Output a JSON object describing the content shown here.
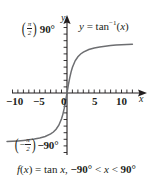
{
  "figure": {
    "caption": "f(x) = tan x, −90° < x < 90°",
    "caption_parts": {
      "fx": "f",
      "open": "(",
      "var1": "x",
      "close": ")",
      "equals": " = tan ",
      "var2": "x",
      "comma": ", ",
      "lower": "−90°",
      "lt1": " < ",
      "var3": "x",
      "lt2": " < ",
      "upper": "90°"
    },
    "equation": {
      "y": "y",
      "equals": " = ",
      "func": "tan",
      "exponent": "−1",
      "open": "(",
      "arg": "x",
      "close": ")"
    },
    "axes": {
      "x_label": "x",
      "y_label": "y",
      "x_ticks": [
        "−10",
        "−5",
        "0",
        "5",
        "10"
      ],
      "x_tick_values": [
        -10,
        -5,
        0,
        5,
        10
      ],
      "x_range": [
        -11.2,
        12.5
      ],
      "y_range": [
        -110,
        110
      ],
      "upper_asymptote_label": "90°",
      "upper_asymptote_fraction": {
        "numerator": "π",
        "denominator": "2",
        "sign": ""
      },
      "lower_asymptote_label": "−90°",
      "lower_asymptote_fraction": {
        "numerator": "π",
        "denominator": "2",
        "sign": "−"
      }
    },
    "colors": {
      "curve": "#6d6e71",
      "axis": "#231f20",
      "text": "#231f20",
      "background": "#ffffff"
    }
  },
  "chart_data": {
    "type": "line",
    "title": "",
    "subtitle": "",
    "xlabel": "x",
    "ylabel": "y",
    "xlim": [
      -11.2,
      12.5
    ],
    "ylim": [
      -110,
      110
    ],
    "grid": false,
    "legend": "none",
    "annotations": [
      {
        "text": "y = tan−1(x)",
        "x": 4.5,
        "y": 95,
        "role": "curve-equation"
      },
      {
        "text": "(π/2) 90°",
        "x": -8.5,
        "y": 90,
        "role": "upper-asymptote"
      },
      {
        "text": "(−π/2) −90°",
        "x": -9.5,
        "y": -90,
        "role": "lower-asymptote"
      }
    ],
    "xticks": [
      -10,
      -5,
      0,
      5,
      10
    ],
    "xticklabels": [
      "−10",
      "−5",
      "0",
      "5",
      "10"
    ],
    "minor_tick_step": 1,
    "yticks": [
      -90,
      90
    ],
    "yticklabels": [
      "−90°",
      "90°"
    ],
    "series": [
      {
        "name": "y = tan⁻¹(x)",
        "color": "#6d6e71",
        "x": [
          -11,
          -10,
          -9,
          -8,
          -7,
          -6,
          -5,
          -4,
          -3,
          -2.5,
          -2,
          -1.5,
          -1,
          -0.75,
          -0.5,
          -0.25,
          0,
          0.25,
          0.5,
          0.75,
          1,
          1.5,
          2,
          2.5,
          3,
          4,
          5,
          6,
          7,
          8,
          9,
          10,
          11,
          12
        ],
        "y": [
          -84.8,
          -84.3,
          -83.7,
          -82.9,
          -81.9,
          -80.5,
          -78.7,
          -76.0,
          -71.6,
          -68.2,
          -63.4,
          -56.3,
          -45.0,
          -36.9,
          -26.6,
          -14.0,
          0,
          14.0,
          26.6,
          36.9,
          45.0,
          56.3,
          63.4,
          68.2,
          71.6,
          76.0,
          78.7,
          80.5,
          81.9,
          82.9,
          83.7,
          84.3,
          84.8,
          85.2
        ]
      }
    ],
    "asymptotes": [
      {
        "value": 90,
        "label": "90°",
        "orientation": "horizontal"
      },
      {
        "value": -90,
        "label": "−90°",
        "orientation": "horizontal"
      }
    ]
  }
}
